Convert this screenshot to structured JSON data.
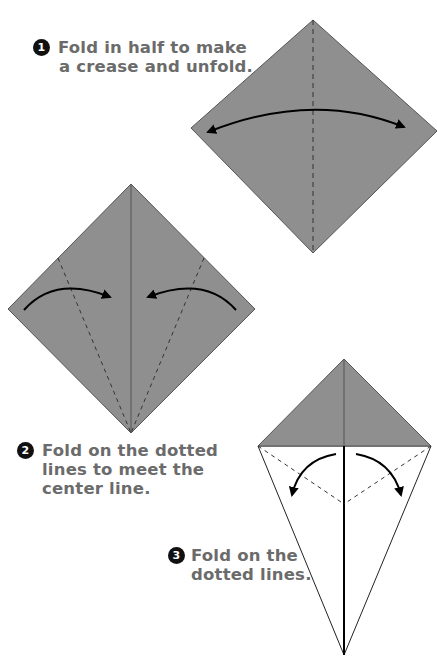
{
  "colors": {
    "paper": "#8f8f8f",
    "paper_edge": "#555555",
    "crease": "#333333",
    "arrow": "#000000",
    "text": "#6b6b6b"
  },
  "steps": [
    {
      "number": "1",
      "lines": [
        "Fold in half to make",
        "a crease and unfold."
      ],
      "figure": "square rotated as diamond, vertical dashed crease, double-headed arc arrow"
    },
    {
      "number": "2",
      "lines": [
        "Fold on the dotted",
        "lines to meet the",
        "center line."
      ],
      "figure": "diamond with center line, two dashed fold lines from bottom point, two curved arrows toward center"
    },
    {
      "number": "3",
      "lines": [
        "Fold on the",
        "dotted lines."
      ],
      "figure": "kite shape, gray top triangle, two dashed fold lines, two curved arrows pointing down-outward"
    }
  ]
}
